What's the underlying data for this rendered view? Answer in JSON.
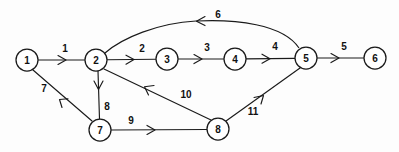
{
  "diagram": {
    "type": "directed-graph",
    "canvas": {
      "width": 399,
      "height": 152
    },
    "style": {
      "background_color": "#fdfdfd",
      "stroke_color": "#1a1a1a",
      "node_fill": "#ffffff",
      "node_radius": 11
    },
    "nodes": [
      {
        "id": "n1",
        "label": "1",
        "x": 27,
        "y": 60
      },
      {
        "id": "n2",
        "label": "2",
        "x": 96,
        "y": 60
      },
      {
        "id": "n3",
        "label": "3",
        "x": 167,
        "y": 59
      },
      {
        "id": "n4",
        "label": "4",
        "x": 235,
        "y": 59
      },
      {
        "id": "n5",
        "label": "5",
        "x": 306,
        "y": 58
      },
      {
        "id": "n6",
        "label": "6",
        "x": 375,
        "y": 58
      },
      {
        "id": "n7",
        "label": "7",
        "x": 100,
        "y": 130
      },
      {
        "id": "n8",
        "label": "8",
        "x": 218,
        "y": 129
      }
    ],
    "edges": [
      {
        "id": "e1",
        "label": "1",
        "from": "n1",
        "to": "n2",
        "shape": "straight",
        "label_x": 65,
        "label_y": 48
      },
      {
        "id": "e2",
        "label": "2",
        "from": "n2",
        "to": "n3",
        "shape": "straight",
        "label_x": 142,
        "label_y": 48
      },
      {
        "id": "e3",
        "label": "3",
        "from": "n3",
        "to": "n4",
        "shape": "straight",
        "label_x": 207,
        "label_y": 47
      },
      {
        "id": "e4",
        "label": "4",
        "from": "n4",
        "to": "n5",
        "shape": "straight",
        "label_x": 275,
        "label_y": 46
      },
      {
        "id": "e5",
        "label": "5",
        "from": "n5",
        "to": "n6",
        "shape": "straight",
        "label_x": 344,
        "label_y": 46
      },
      {
        "id": "e6",
        "label": "6",
        "from": "n5",
        "to": "n2",
        "shape": "arc",
        "label_x": 218,
        "label_y": 14
      },
      {
        "id": "e7",
        "label": "7",
        "from": "n7",
        "to": "n1",
        "shape": "straight",
        "label_x": 44,
        "label_y": 88
      },
      {
        "id": "e8",
        "label": "8",
        "from": "n2",
        "to": "n7",
        "shape": "straight",
        "label_x": 107,
        "label_y": 106
      },
      {
        "id": "e9",
        "label": "9",
        "from": "n7",
        "to": "n8",
        "shape": "straight",
        "label_x": 131,
        "label_y": 120
      },
      {
        "id": "e10",
        "label": "10",
        "from": "n8",
        "to": "n2",
        "shape": "straight",
        "label_x": 186,
        "label_y": 94
      },
      {
        "id": "e11",
        "label": "11",
        "from": "n8",
        "to": "n5",
        "shape": "straight",
        "label_x": 253,
        "label_y": 111
      }
    ]
  }
}
